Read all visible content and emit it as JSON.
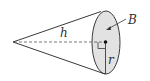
{
  "diagram": {
    "type": "geometry",
    "labels": {
      "height": "h",
      "radius": "r",
      "base": "B"
    },
    "colors": {
      "stroke": "#3a3a3a",
      "base_fill": "#e2e2e2",
      "dashed": "#555555",
      "label": "#333333"
    }
  }
}
